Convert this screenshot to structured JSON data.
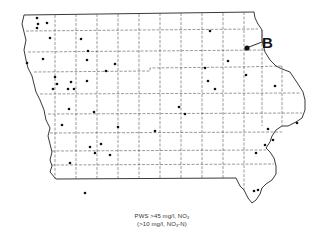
{
  "map": {
    "title": "Iowa counties — public water supplies with high nitrate",
    "border_color": "#222222",
    "county_line_color": "#555555",
    "dot_color": "#111111",
    "highlight": {
      "label": "B",
      "x": 247,
      "y": 48
    },
    "dots": [
      [
        37,
        18
      ],
      [
        38,
        24
      ],
      [
        37,
        28
      ],
      [
        47,
        23
      ],
      [
        50,
        38
      ],
      [
        81,
        39
      ],
      [
        88,
        51
      ],
      [
        87,
        60
      ],
      [
        27,
        63
      ],
      [
        43,
        59
      ],
      [
        115,
        64
      ],
      [
        106,
        71
      ],
      [
        55,
        77
      ],
      [
        57,
        84
      ],
      [
        53,
        89
      ],
      [
        71,
        82
      ],
      [
        68,
        89
      ],
      [
        74,
        89
      ],
      [
        87,
        81
      ],
      [
        69,
        109
      ],
      [
        94,
        112
      ],
      [
        210,
        31
      ],
      [
        228,
        61
      ],
      [
        205,
        68
      ],
      [
        208,
        81
      ],
      [
        215,
        89
      ],
      [
        246,
        75
      ],
      [
        275,
        86
      ],
      [
        179,
        107
      ],
      [
        185,
        114
      ],
      [
        62,
        125
      ],
      [
        118,
        127
      ],
      [
        155,
        131
      ],
      [
        90,
        147
      ],
      [
        101,
        144
      ],
      [
        95,
        153
      ],
      [
        110,
        155
      ],
      [
        70,
        163
      ],
      [
        85,
        193
      ],
      [
        268,
        129
      ],
      [
        297,
        123
      ],
      [
        265,
        145
      ],
      [
        273,
        140
      ],
      [
        256,
        153
      ],
      [
        254,
        191
      ],
      [
        258,
        190
      ]
    ]
  },
  "caption": {
    "line1_prefix": "PWS >45 mg/l, NO",
    "line1_sub": "3",
    "line2_prefix": "(>10 mg/l, NO",
    "line2_sub": "3",
    "line2_suffix": "-N)"
  }
}
